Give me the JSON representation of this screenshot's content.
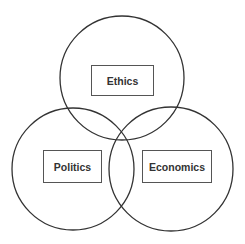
{
  "diagram": {
    "type": "venn",
    "sets": [
      {
        "id": "ethics",
        "label": "Ethics"
      },
      {
        "id": "politics",
        "label": "Politics"
      },
      {
        "id": "economics",
        "label": "Economics"
      }
    ],
    "colors": {
      "stroke": "#333333",
      "background": "#ffffff",
      "text": "#333333"
    }
  }
}
